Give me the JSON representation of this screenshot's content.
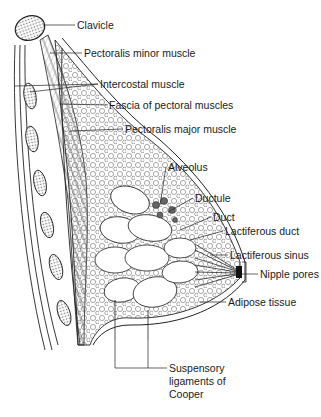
{
  "diagram": {
    "labels": [
      {
        "id": "clavicle",
        "text": "Clavicle",
        "x": 77,
        "y": 20
      },
      {
        "id": "pectoralis-minor",
        "text": "Pectoralis minor muscle",
        "x": 84,
        "y": 48
      },
      {
        "id": "intercostal",
        "text": "Intercostal muscle",
        "x": 100,
        "y": 79
      },
      {
        "id": "fascia",
        "text": "Fascia of pectoral muscles",
        "x": 109,
        "y": 100
      },
      {
        "id": "pectoralis-major",
        "text": "Pectoralis major muscle",
        "x": 125,
        "y": 124
      },
      {
        "id": "alveolus",
        "text": "Alveolus",
        "x": 168,
        "y": 162
      },
      {
        "id": "ductule",
        "text": "Ductule",
        "x": 195,
        "y": 193
      },
      {
        "id": "duct",
        "text": "Duct",
        "x": 213,
        "y": 212
      },
      {
        "id": "lactiferous-duct",
        "text": "Lactiferous duct",
        "x": 225,
        "y": 226
      },
      {
        "id": "lactiferous-sinus",
        "text": "Lactiferous sinus",
        "x": 230,
        "y": 250
      },
      {
        "id": "nipple-pores",
        "text": "Nipple pores",
        "x": 244,
        "y": 269
      },
      {
        "id": "adipose",
        "text": "Adipose tissue",
        "x": 228,
        "y": 297
      },
      {
        "id": "cooper",
        "text": "Suspensory ligaments of Cooper",
        "x": 169,
        "y": 367
      }
    ]
  }
}
